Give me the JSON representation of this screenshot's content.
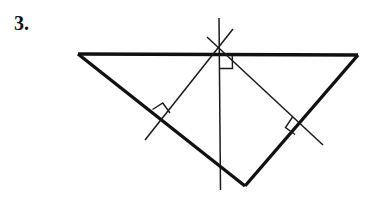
{
  "figure": {
    "label": "3.",
    "kind": "geometry-diagram",
    "colors": {
      "background": "#ffffff",
      "outline": "#111111",
      "construction_line": "#1a1a1a"
    },
    "triangle": {
      "name": "obtuse-triangle",
      "stroke_width": 3.4,
      "vertices": [
        {
          "name": "vertex-left",
          "x": 78,
          "y": 54
        },
        {
          "name": "vertex-right",
          "x": 358,
          "y": 55
        },
        {
          "name": "vertex-bottom",
          "x": 245,
          "y": 186
        }
      ],
      "sides": [
        {
          "name": "side-top",
          "from": "vertex-left",
          "to": "vertex-right"
        },
        {
          "name": "side-lower-right",
          "from": "vertex-right",
          "to": "vertex-bottom"
        },
        {
          "name": "side-lower-left",
          "from": "vertex-bottom",
          "to": "vertex-left"
        }
      ]
    },
    "circumcenter": {
      "name": "circumcenter-point",
      "x": 219,
      "y": 50
    },
    "bisectors": [
      {
        "name": "perpendicular-bisector-top-side",
        "orientation": "vertical",
        "x1": 219,
        "y1": 18,
        "x2": 220,
        "y2": 190,
        "foot": {
          "x": 219,
          "y": 54
        }
      },
      {
        "name": "perpendicular-bisector-lower-left-side",
        "orientation": "diagonal-up-right",
        "x1": 145,
        "y1": 140,
        "x2": 233,
        "y2": 29,
        "foot": {
          "x": 161,
          "y": 119
        }
      },
      {
        "name": "perpendicular-bisector-lower-right-side",
        "orientation": "diagonal-down-right",
        "x1": 207,
        "y1": 37,
        "x2": 323,
        "y2": 145,
        "foot": {
          "x": 301,
          "y": 125
        }
      }
    ],
    "right_angle_marks": [
      {
        "name": "right-angle-mark-top-side",
        "size": 13,
        "at_foot_of": "perpendicular-bisector-top-side"
      },
      {
        "name": "right-angle-mark-lower-left-side",
        "size": 13,
        "at_foot_of": "perpendicular-bisector-lower-left-side"
      },
      {
        "name": "right-angle-mark-lower-right-side",
        "size": 13,
        "at_foot_of": "perpendicular-bisector-lower-right-side"
      }
    ]
  }
}
